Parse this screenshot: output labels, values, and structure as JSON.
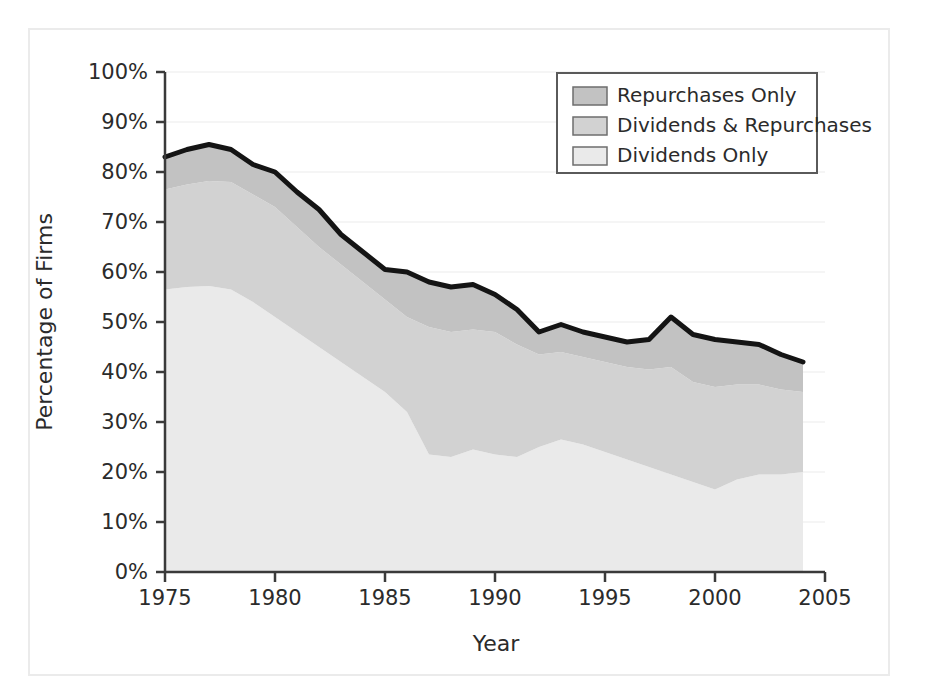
{
  "chart_data": {
    "type": "area",
    "stacked": true,
    "title": "",
    "xlabel": "Year",
    "ylabel": "Percentage of Firms",
    "xlim": [
      1975,
      2005
    ],
    "ylim": [
      0,
      100
    ],
    "xticks": [
      1975,
      1980,
      1985,
      1990,
      1995,
      2000,
      2005
    ],
    "yticks": [
      "0%",
      "10%",
      "20%",
      "30%",
      "40%",
      "50%",
      "60%",
      "70%",
      "80%",
      "90%",
      "100%"
    ],
    "ytick_values": [
      0,
      10,
      20,
      30,
      40,
      50,
      60,
      70,
      80,
      90,
      100
    ],
    "grid": true,
    "legend_position": "top-right",
    "x": [
      1975,
      1976,
      1977,
      1978,
      1979,
      1980,
      1981,
      1982,
      1983,
      1984,
      1985,
      1986,
      1987,
      1988,
      1989,
      1990,
      1991,
      1992,
      1993,
      1994,
      1995,
      1996,
      1997,
      1998,
      1999,
      2000,
      2001,
      2002,
      2003,
      2004
    ],
    "series": [
      {
        "name": "Dividends Only",
        "order": 1,
        "color": "#eaeaea",
        "values": [
          56.5,
          57.0,
          57.2,
          56.5,
          54.0,
          51.0,
          48.0,
          45.0,
          42.0,
          39.0,
          36.0,
          32.0,
          23.5,
          23.0,
          24.5,
          23.5,
          23.0,
          25.0,
          26.5,
          25.5,
          24.0,
          22.5,
          21.0,
          19.5,
          18.0,
          16.5,
          18.5,
          19.5,
          19.5,
          20.0
        ]
      },
      {
        "name": "Dividends & Repurchases",
        "order": 2,
        "color": "#d2d2d2",
        "values": [
          20.0,
          20.5,
          21.0,
          21.5,
          21.5,
          22.0,
          21.0,
          20.0,
          19.5,
          19.0,
          18.5,
          19.0,
          25.5,
          25.0,
          24.0,
          24.5,
          22.5,
          18.5,
          17.5,
          17.5,
          18.0,
          18.5,
          19.5,
          21.5,
          20.0,
          20.5,
          19.0,
          18.0,
          17.0,
          16.0
        ]
      },
      {
        "name": "Repurchases Only",
        "order": 3,
        "color": "#c2c2c2",
        "values": [
          6.5,
          7.0,
          7.3,
          6.5,
          6.0,
          7.0,
          7.0,
          7.5,
          6.0,
          6.0,
          6.0,
          9.0,
          9.0,
          9.0,
          9.0,
          7.5,
          7.0,
          4.5,
          5.5,
          5.0,
          5.0,
          5.0,
          6.0,
          10.0,
          9.5,
          9.5,
          8.5,
          8.0,
          7.0,
          6.0
        ]
      }
    ],
    "totals": [
      83.0,
      84.5,
      85.5,
      84.5,
      81.5,
      80.0,
      76.0,
      72.5,
      67.5,
      64.0,
      60.5,
      60.0,
      58.0,
      57.0,
      57.5,
      55.5,
      52.5,
      48.0,
      49.5,
      48.0,
      47.0,
      46.0,
      46.5,
      51.0,
      47.5,
      46.5,
      46.0,
      45.5,
      43.5,
      42.0
    ],
    "total_line_color": "#141414"
  },
  "legend": {
    "items": [
      {
        "label": "Repurchases Only",
        "swatch": "#c2c2c2"
      },
      {
        "label": "Dividends & Repurchases",
        "swatch": "#d2d2d2"
      },
      {
        "label": "Dividends Only",
        "swatch": "#eaeaea"
      }
    ],
    "border_color": "#5a5a5a",
    "background": "#ffffff"
  },
  "axes": {
    "y_title": "Percentage of Firms",
    "x_title": "Year",
    "y_tick_labels": [
      "100%",
      "90%",
      "80%",
      "70%",
      "60%",
      "50%",
      "40%",
      "30%",
      "20%",
      "10%",
      "0%"
    ],
    "x_tick_labels": [
      "1975",
      "1980",
      "1985",
      "1990",
      "1995",
      "2000",
      "2005"
    ],
    "axis_color": "#3a3a3a",
    "grid_color": "#f2f2f2"
  }
}
